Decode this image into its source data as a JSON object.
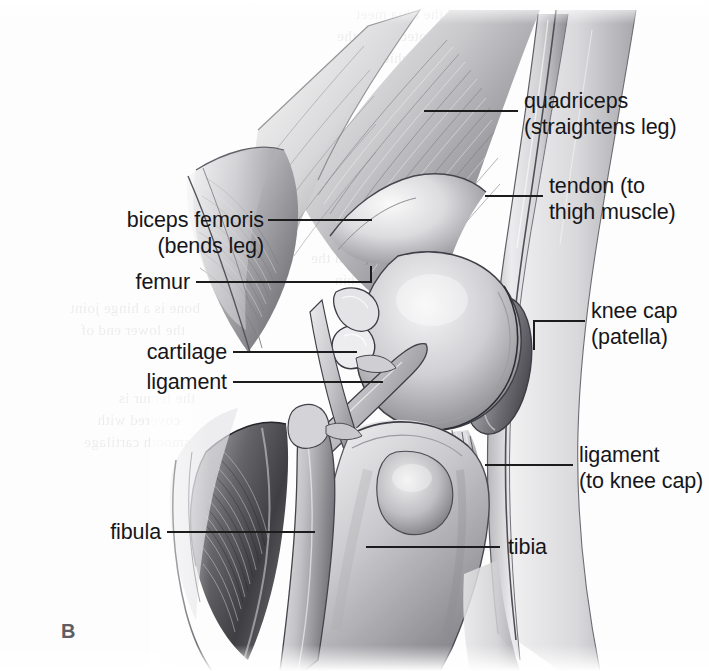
{
  "figure": {
    "letter": "B",
    "colors": {
      "ink": "#16161a",
      "leader": "#1c1c1c",
      "figure_letter": "#5d5d63",
      "background": "#fdfdfd",
      "shading_dark": "#4c4c50",
      "shading_mid": "#9a9a9e",
      "shading_light": "#d6d6d8"
    }
  },
  "labels": [
    {
      "id": "quadriceps",
      "name": "quadriceps",
      "lines": [
        "quadriceps",
        "(straightens leg)"
      ],
      "side": "right"
    },
    {
      "id": "tendon",
      "name": "tendon-to-thigh-muscle",
      "lines": [
        "tendon (to",
        "thigh muscle)"
      ],
      "side": "right"
    },
    {
      "id": "knee-cap",
      "name": "knee-cap-patella",
      "lines": [
        "knee cap",
        "(patella)"
      ],
      "side": "right"
    },
    {
      "id": "ligament-knee-cap",
      "name": "ligament-to-knee-cap",
      "lines": [
        "ligament",
        "(to knee cap)"
      ],
      "side": "right"
    },
    {
      "id": "tibia",
      "name": "tibia",
      "lines": [
        "tibia"
      ],
      "side": "right"
    },
    {
      "id": "biceps-femoris",
      "name": "biceps-femoris",
      "lines": [
        "biceps femoris",
        "(bends leg)"
      ],
      "side": "left"
    },
    {
      "id": "femur",
      "name": "femur",
      "lines": [
        "femur"
      ],
      "side": "left"
    },
    {
      "id": "cartilage",
      "name": "cartilage",
      "lines": [
        "cartilage"
      ],
      "side": "left"
    },
    {
      "id": "ligament",
      "name": "ligament",
      "lines": [
        "ligament"
      ],
      "side": "left"
    },
    {
      "id": "fibula",
      "name": "fibula",
      "lines": [
        "fibula"
      ],
      "side": "left"
    }
  ],
  "ghost_text": [
    "and the tibia meet",
    "is protected by the",
    "patella which slides",
    "smoothly over the",
    "lower end of the femur",
    "when the leg bends",
    "and straightens",
    "knee joint between the",
    "thigh bone and shin",
    "bone is a hinge joint",
    "the lower end of",
    "the femur is",
    "covered with",
    "smooth cartilage"
  ]
}
